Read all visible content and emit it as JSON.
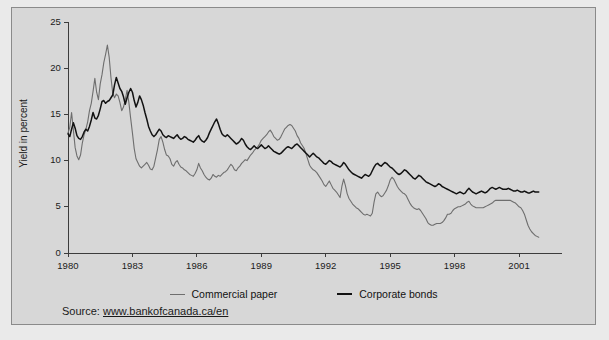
{
  "source": {
    "prefix": "Source:",
    "url": "www.bankofcanada.ca/en"
  },
  "chart_data": {
    "type": "line",
    "title": "",
    "xlabel": "",
    "ylabel": "Yield in percent",
    "xlim": [
      1980.0,
      2003.0
    ],
    "ylim": [
      0,
      25
    ],
    "yticks": [
      0,
      5,
      10,
      15,
      20,
      25
    ],
    "ytick_labels": [
      "0",
      "5",
      "10",
      "15",
      "20",
      "25"
    ],
    "xticks": [
      1980,
      1983,
      1986,
      1989,
      1992,
      1995,
      1998,
      2001
    ],
    "xtick_labels": [
      "1980",
      "1983",
      "1986",
      "1989",
      "1992",
      "1995",
      "1998",
      "2001"
    ],
    "grid": false,
    "legend_position": "below-axes",
    "colors": {
      "commercial_paper": "#6e6e6e",
      "corporate_bonds": "#121212",
      "axis": "#3c3c3c",
      "background": "#d7d7d7",
      "frame": "#8a8a8a"
    },
    "series": [
      {
        "name": "Commercial paper",
        "color": "#6e6e6e",
        "x_start": 1980.0,
        "x_step": 0.0833333,
        "values": [
          13.0,
          13.6,
          15.2,
          13.3,
          11.4,
          10.5,
          10.1,
          10.6,
          11.9,
          12.8,
          13.4,
          14.2,
          15.4,
          16.2,
          17.5,
          18.9,
          17.4,
          16.6,
          18.3,
          19.3,
          20.6,
          21.5,
          22.5,
          21.2,
          19.0,
          17.3,
          16.8,
          17.2,
          17.0,
          16.3,
          15.4,
          15.8,
          16.6,
          17.6,
          16.3,
          14.6,
          13.0,
          11.3,
          10.2,
          9.8,
          9.4,
          9.2,
          9.4,
          9.6,
          9.8,
          9.5,
          9.1,
          9.0,
          9.4,
          10.3,
          11.2,
          12.3,
          12.6,
          12.0,
          11.2,
          10.6,
          10.5,
          10.2,
          9.6,
          9.4,
          9.8,
          10.0,
          9.6,
          9.3,
          9.2,
          9.0,
          8.9,
          8.7,
          8.5,
          8.4,
          8.3,
          8.6,
          9.0,
          9.7,
          9.2,
          8.9,
          8.5,
          8.2,
          8.0,
          7.9,
          8.1,
          8.5,
          8.3,
          8.2,
          8.4,
          8.3,
          8.5,
          8.7,
          8.8,
          9.0,
          9.3,
          9.6,
          9.4,
          9.0,
          8.9,
          9.2,
          9.4,
          9.7,
          9.9,
          10.1,
          10.0,
          10.3,
          10.6,
          10.8,
          11.1,
          11.3,
          11.5,
          11.8,
          12.2,
          12.4,
          12.6,
          12.8,
          13.1,
          13.3,
          13.0,
          12.6,
          12.4,
          12.2,
          12.3,
          12.6,
          13.0,
          13.4,
          13.6,
          13.8,
          13.9,
          13.8,
          13.5,
          13.2,
          12.7,
          12.4,
          11.9,
          11.6,
          11.3,
          10.7,
          10.1,
          9.5,
          9.2,
          9.0,
          8.9,
          8.7,
          8.4,
          8.1,
          7.8,
          7.4,
          7.2,
          7.5,
          7.8,
          7.4,
          7.0,
          6.8,
          6.6,
          6.3,
          6.0,
          7.2,
          8.0,
          7.3,
          6.4,
          5.9,
          5.6,
          5.3,
          5.1,
          4.9,
          4.8,
          4.6,
          4.4,
          4.2,
          4.1,
          4.2,
          4.1,
          4.0,
          4.3,
          5.5,
          6.4,
          6.6,
          6.3,
          6.1,
          6.2,
          6.5,
          6.8,
          7.3,
          7.9,
          8.2,
          8.0,
          7.6,
          7.2,
          6.9,
          6.7,
          6.5,
          6.4,
          6.2,
          5.8,
          5.4,
          5.1,
          4.9,
          4.8,
          4.7,
          4.8,
          4.6,
          4.3,
          4.0,
          3.7,
          3.3,
          3.1,
          3.0,
          3.0,
          3.1,
          3.2,
          3.2,
          3.2,
          3.3,
          3.5,
          3.8,
          4.2,
          4.2,
          4.3,
          4.6,
          4.8,
          4.9,
          5.0,
          5.0,
          5.1,
          5.2,
          5.3,
          5.5,
          5.6,
          5.3,
          5.1,
          5.0,
          4.9,
          4.9,
          4.9,
          4.9,
          4.9,
          5.0,
          5.1,
          5.2,
          5.3,
          5.4,
          5.6,
          5.7,
          5.7,
          5.7,
          5.7,
          5.7,
          5.7,
          5.7,
          5.7,
          5.7,
          5.6,
          5.5,
          5.4,
          5.2,
          5.0,
          4.9,
          4.6,
          4.2,
          3.6,
          3.0,
          2.6,
          2.3,
          2.1,
          1.9,
          1.8,
          1.7
        ]
      },
      {
        "name": "Corporate bonds",
        "color": "#121212",
        "x_start": 1980.0,
        "x_step": 0.0833333,
        "values": [
          12.9,
          12.6,
          13.4,
          14.1,
          13.5,
          12.7,
          12.4,
          12.3,
          12.6,
          13.1,
          13.4,
          13.2,
          13.7,
          14.4,
          15.2,
          14.6,
          14.5,
          14.9,
          15.6,
          16.4,
          16.5,
          16.2,
          16.4,
          16.5,
          16.8,
          17.1,
          18.2,
          19.0,
          18.4,
          17.8,
          17.5,
          16.9,
          16.1,
          16.8,
          17.4,
          17.8,
          17.4,
          16.5,
          15.8,
          16.3,
          17.0,
          16.6,
          16.0,
          15.2,
          14.5,
          13.7,
          13.2,
          12.8,
          12.6,
          12.8,
          13.1,
          13.4,
          13.2,
          12.8,
          12.6,
          12.5,
          12.7,
          12.6,
          12.5,
          12.4,
          12.6,
          12.8,
          12.5,
          12.3,
          12.4,
          12.6,
          12.5,
          12.3,
          12.2,
          12.1,
          12.0,
          12.2,
          12.5,
          12.7,
          12.3,
          12.1,
          12.0,
          12.2,
          12.5,
          13.0,
          13.4,
          13.8,
          14.2,
          14.5,
          14.0,
          13.4,
          12.9,
          12.7,
          12.6,
          12.8,
          12.6,
          12.4,
          12.2,
          12.0,
          11.8,
          11.9,
          12.1,
          12.4,
          12.2,
          11.8,
          11.5,
          11.3,
          11.2,
          11.4,
          11.6,
          11.4,
          11.3,
          11.5,
          11.7,
          11.5,
          11.3,
          11.4,
          11.6,
          11.4,
          11.2,
          11.0,
          10.9,
          10.8,
          10.7,
          10.8,
          11.0,
          11.2,
          11.4,
          11.5,
          11.4,
          11.3,
          11.5,
          11.7,
          11.8,
          11.6,
          11.4,
          11.2,
          11.0,
          10.8,
          10.6,
          10.4,
          10.6,
          10.8,
          10.6,
          10.4,
          10.3,
          10.1,
          9.9,
          9.7,
          9.6,
          9.8,
          10.0,
          9.9,
          9.7,
          9.6,
          9.5,
          9.4,
          9.3,
          9.5,
          9.8,
          9.6,
          9.3,
          9.0,
          8.8,
          8.6,
          8.5,
          8.4,
          8.3,
          8.2,
          8.1,
          8.3,
          8.5,
          8.4,
          8.3,
          8.5,
          8.9,
          9.3,
          9.6,
          9.7,
          9.5,
          9.4,
          9.6,
          9.8,
          9.7,
          9.5,
          9.3,
          9.2,
          9.0,
          8.8,
          8.6,
          8.5,
          8.6,
          8.8,
          9.0,
          8.9,
          8.7,
          8.5,
          8.3,
          8.1,
          8.0,
          8.2,
          8.4,
          8.3,
          8.1,
          7.9,
          7.7,
          7.6,
          7.5,
          7.4,
          7.3,
          7.2,
          7.3,
          7.5,
          7.4,
          7.2,
          7.1,
          7.0,
          6.9,
          6.8,
          6.7,
          6.6,
          6.5,
          6.4,
          6.5,
          6.6,
          6.5,
          6.4,
          6.5,
          6.8,
          7.0,
          6.8,
          6.6,
          6.5,
          6.4,
          6.5,
          6.6,
          6.7,
          6.6,
          6.5,
          6.6,
          6.8,
          7.0,
          7.1,
          7.0,
          6.9,
          7.0,
          7.1,
          7.0,
          6.9,
          6.9,
          6.9,
          7.0,
          6.9,
          6.8,
          6.7,
          6.7,
          6.8,
          6.7,
          6.6,
          6.6,
          6.7,
          6.6,
          6.5,
          6.5,
          6.6,
          6.7,
          6.6,
          6.6,
          6.6
        ]
      }
    ]
  }
}
